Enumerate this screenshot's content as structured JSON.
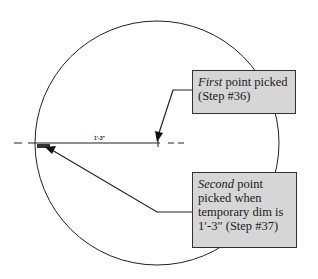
{
  "diagram": {
    "dimension_label": "1'-3\"",
    "callouts": [
      {
        "id": "first",
        "emphasis": "First",
        "text": " point picked (Step #36)"
      },
      {
        "id": "second",
        "emphasis": "Second",
        "text": " point picked when temporary dim is 1′-3″ (Step #37)"
      }
    ],
    "colors": {
      "callout_fill": "#d6d6d6",
      "stroke": "#222222"
    }
  }
}
